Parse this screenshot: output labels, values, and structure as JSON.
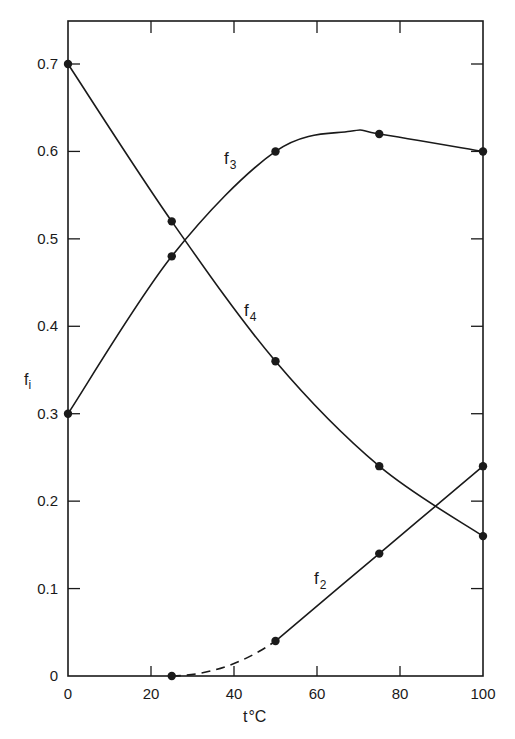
{
  "chart_data": {
    "type": "line",
    "title": "",
    "xlabel": "t°C",
    "ylabel": "f_i",
    "xlim": [
      0,
      100
    ],
    "ylim": [
      0,
      0.7
    ],
    "grid": false,
    "x_ticks": [
      0,
      20,
      40,
      60,
      80,
      100
    ],
    "x_tick_labels": [
      "0",
      "20",
      "40",
      "60",
      "80",
      "100"
    ],
    "y_ticks": [
      0,
      0.1,
      0.2,
      0.3,
      0.4,
      0.5,
      0.6,
      0.7
    ],
    "y_tick_labels": [
      "0",
      "0.1",
      "0.2",
      "0.3",
      "0.4",
      "0.5",
      "0.6",
      "0.7"
    ],
    "series": [
      {
        "name": "f3",
        "label_main": "f",
        "label_sub": "3",
        "x": [
          0,
          25,
          50,
          75,
          100
        ],
        "values": [
          0.3,
          0.48,
          0.6,
          0.62,
          0.6
        ],
        "style": "solid"
      },
      {
        "name": "f4",
        "label_main": "f",
        "label_sub": "4",
        "x": [
          0,
          25,
          50,
          75,
          100
        ],
        "values": [
          0.7,
          0.52,
          0.36,
          0.24,
          0.16
        ],
        "style": "solid"
      },
      {
        "name": "f2",
        "label_main": "f",
        "label_sub": "2",
        "x": [
          25,
          50,
          75,
          100
        ],
        "values": [
          0.0,
          0.04,
          0.14,
          0.24
        ],
        "style": "dashed from 25 to 50, solid from 50 to 100"
      }
    ],
    "annotations": [
      "f3 label near (38, 0.59)",
      "f4 label near (41, 0.41)",
      "f2 label near (58, 0.10)"
    ],
    "legend": "none (curves labeled inline)"
  },
  "labels": {
    "xlabel_main": "t",
    "xlabel_deg": "°C",
    "ylabel_main": "f",
    "ylabel_sub": "i"
  },
  "colors": {
    "ink": "#1a1a1a",
    "background": "#ffffff"
  }
}
